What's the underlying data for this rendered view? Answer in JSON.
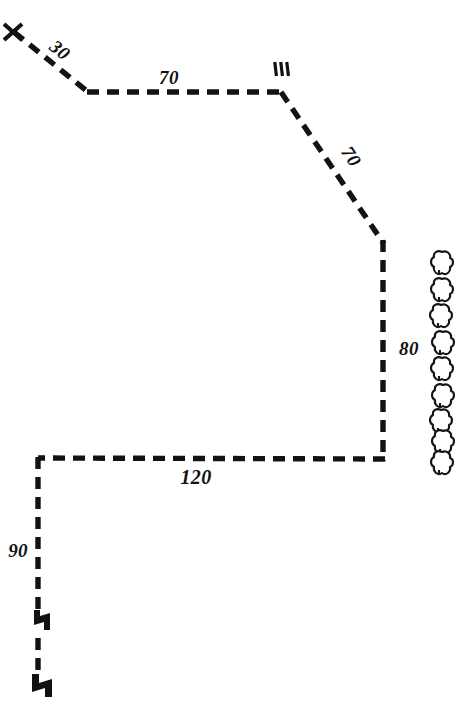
{
  "figure": {
    "kind": "survey-plat-sketch",
    "background_color": "#ffffff",
    "ink_color": "#121212",
    "width": 464,
    "height": 702
  },
  "corner_marker": {
    "name": "x-corner-mark",
    "label": "X",
    "x": 12,
    "y": 30
  },
  "station_marker": {
    "name": "boundary-monument-mark",
    "label": "|||",
    "x": 281,
    "y": 70
  },
  "boundary": {
    "segments": [
      {
        "id": "seg-30",
        "label": "30",
        "bearing": "northwest-diagonal",
        "from": [
          14,
          32
        ],
        "to": [
          88,
          92
        ],
        "label_x": 56,
        "label_y": 55,
        "label_rotation": 39
      },
      {
        "id": "seg-70-north",
        "label": "70",
        "bearing": "east",
        "from": [
          88,
          92
        ],
        "to": [
          281,
          92
        ],
        "label_x": 169,
        "label_y": 84,
        "label_rotation": 0
      },
      {
        "id": "seg-70-diagonal",
        "label": "70",
        "bearing": "southeast-diagonal",
        "from": [
          281,
          92
        ],
        "to": [
          383,
          243
        ],
        "label_x": 346,
        "label_y": 160,
        "label_rotation": 56
      },
      {
        "id": "seg-80",
        "label": "80",
        "bearing": "south",
        "from": [
          383,
          243
        ],
        "to": [
          383,
          460
        ],
        "label_x": 399,
        "label_y": 348,
        "label_rotation": 0
      },
      {
        "id": "seg-120",
        "label": "120",
        "bearing": "west",
        "from": [
          383,
          460
        ],
        "to": [
          38,
          458
        ],
        "label_x": 196,
        "label_y": 480,
        "label_rotation": 0
      },
      {
        "id": "seg-90",
        "label": "90",
        "bearing": "south",
        "from": [
          38,
          458
        ],
        "to": [
          38,
          695
        ],
        "label_x": 22,
        "label_y": 552,
        "label_rotation": 0
      }
    ]
  },
  "jog_markers": [
    {
      "id": "jog-upper",
      "x": 38,
      "y": 620
    },
    {
      "id": "jog-lower",
      "x": 38,
      "y": 685
    }
  ],
  "tree_row": {
    "name": "tree-symbol-column",
    "count": 9,
    "center_x": 442,
    "first_y": 263,
    "spacing": 26.5,
    "radius": 11
  },
  "dimension_labels": [
    "30",
    "70",
    "70",
    "80",
    "120",
    "90"
  ]
}
